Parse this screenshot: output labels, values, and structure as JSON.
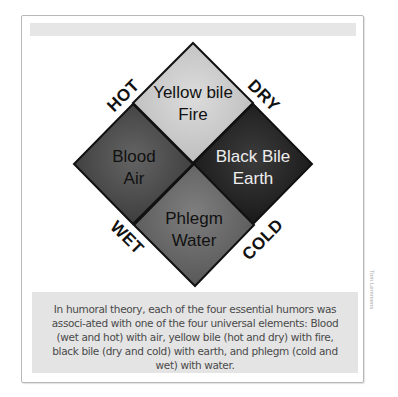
{
  "diagram": {
    "quadrants": [
      {
        "position": "top",
        "humor": "Yellow bile",
        "element": "Fire",
        "fill": "#c4c4c4",
        "highlight": "#d8d8d8",
        "text_color": "#111111"
      },
      {
        "position": "left",
        "humor": "Blood",
        "element": "Air",
        "fill": "#454545",
        "highlight": "#5e5e5e",
        "text_color": "#111111"
      },
      {
        "position": "right",
        "humor": "Black Bile",
        "element": "Earth",
        "fill": "#1e1e1e",
        "highlight": "#383838",
        "text_color": "#eeeeee"
      },
      {
        "position": "bottom",
        "humor": "Phlegm",
        "element": "Water",
        "fill": "#626262",
        "highlight": "#7a7a7a",
        "text_color": "#111111"
      }
    ],
    "qualities": {
      "upper_left": "HOT",
      "upper_right": "DRY",
      "lower_left": "WET",
      "lower_right": "COLD"
    }
  },
  "caption": {
    "text": "In humoral theory, each of the four essential humors was associ-ated with one of the four universal elements: Blood (wet and hot) with air, yellow bile (hot and dry) with fire, black bile (dry and cold) with earth, and phlegm (cold and wet) with water."
  },
  "credit": "Tom Lemmens"
}
